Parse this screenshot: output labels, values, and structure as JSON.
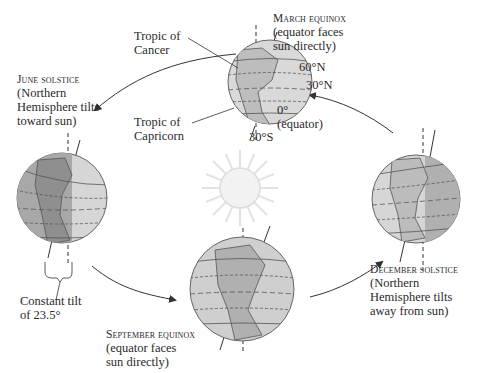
{
  "diagram": {
    "center": {
      "object": "sun"
    },
    "positions": [
      {
        "id": "march",
        "title": "March equinox",
        "lines": [
          "(equator faces",
          "sun directly)"
        ]
      },
      {
        "id": "june",
        "title": "June solstice",
        "lines": [
          "(Northern",
          "Hemisphere tilts",
          "toward sun)"
        ]
      },
      {
        "id": "september",
        "title": "September equinox",
        "lines": [
          "(equator faces",
          "sun directly)"
        ]
      },
      {
        "id": "december",
        "title": "December solstice",
        "lines": [
          "(Northern",
          "Hemisphere tilts",
          "away from sun)"
        ]
      }
    ],
    "latitude_labels": {
      "lat60n": "60°N",
      "lat30n": "30°N",
      "lat0": "0°",
      "equator_note": "(equator)",
      "lat30s": "30°S"
    },
    "tropic_labels": {
      "cancer": [
        "Tropic of",
        "Cancer"
      ],
      "capricorn": [
        "Tropic of",
        "Capricorn"
      ]
    },
    "tilt_label": [
      "Constant tilt",
      "of 23.5°"
    ],
    "colors": {
      "globe_light": "#d9d9d9",
      "globe_dark": "#9e9e9e",
      "land": "#b8b8b8",
      "outline": "#555555",
      "sun_rays": "#e3e3e3",
      "arrow": "#333333"
    }
  }
}
